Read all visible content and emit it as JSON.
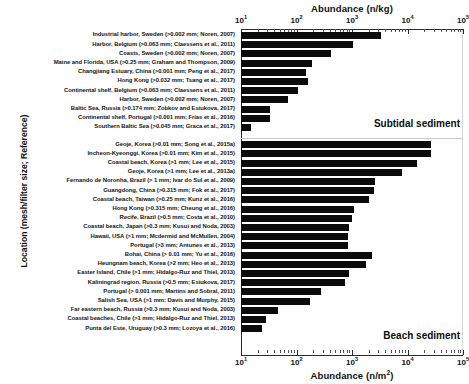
{
  "chart_data": {
    "type": "bar",
    "orientation": "horizontal",
    "title": "",
    "xlabel_top": "Abundance (n/kg)",
    "xlabel_bottom": "Abundance (n/m2)",
    "ylabel": "Location (mesh/filter size; Reference)",
    "xscale": "log",
    "xlim": [
      10,
      100000
    ],
    "grid": false,
    "legend": null,
    "tick_labels": [
      "10^1",
      "10^2",
      "10^3",
      "10^4",
      "10^5"
    ],
    "tick_values": [
      10,
      100,
      1000,
      10000,
      100000
    ],
    "annotations": [
      "Subtidal sediment",
      "Beach sediment"
    ],
    "groups": [
      {
        "name": "Subtidal sediment",
        "axis": "top",
        "unit": "n/kg",
        "categories": [
          "Industrial harbor, Sweden (>0.002 mm; Noren, 2007)",
          "Harbor, Belgium (>0.063 mm; Claessens et al., 2011)",
          "Coasts, Sweden (>0.002 mm; Noren, 2007)",
          "Maine and Florida, USA (>0.25 mm; Graham and Thompson, 2009)",
          "Changjiang Estuary, China (>0.001 mm; Peng et al., 2017)",
          "Hong Kong (>0.032 mm; Tsang et al., 2017)",
          "Continental shelf, Belgium (>0.063 mm; Claessens et al., 2011)",
          "Harbor, Sweden (>0.002 mm; Noren, 2007)",
          "Baltic Sea, Russia (>0.174 mm; Zobkov and Esiukova, 2017)",
          "Continental shelf, Portugal (>0.001 mm; Frias et al., 2016)",
          "Southern Baltic Sea (>0.045 mm; Graca et al., 2017)"
        ],
        "values": [
          3400,
          1050,
          420,
          190,
          150,
          160,
          105,
          70,
          33,
          34,
          15
        ]
      },
      {
        "name": "Beach sediment",
        "axis": "bottom",
        "unit": "n/m2",
        "categories": [
          "Geoje, Korea (>0.01 mm; Song et al., 2015a)",
          "Incheon-Kyeonggi, Korea (>0.01 mm; Kim et al., 2015)",
          "Coastal beach, Korea (>1 mm; Lee et al., 2015)",
          "Geoje, Korea (>1 mm; Lee et al., 2013a)",
          "Fernando de Noronha, Brazil (> 1 mm; Ivar do Sul et al., 2009)",
          "Guangdong, China (>0.315 mm; Fok et al., 2017)",
          "Coastal beach, Taiwan (>0.25 mm; Kunz et al., 2016)",
          "Hong Kong (>0.315 mm; Cheung et al., 2016)",
          "Recife, Brazil (>0.5 mm; Costa et al., 2010)",
          "Coastal beach, Japan (>0.3 mm; Kusui and Noda, 2003)",
          "Hawaii, USA (>1 mm; Mcdermid and McMullen, 2004)",
          "Portugal (>3 mm; Antunes et al., 2013)",
          "Bohai, China (> 0.01 mm; Yu et al., 2016)",
          "Heungnam beach, Korea (>2 mm; Heo et al., 2013)",
          "Easter Island, Chile (>1 mm; Hidalgo-Ruz and Thiel, 2013)",
          "Kaliningrad region, Russia (>0.5 mm; Esiukova, 2017)",
          "Portugal (> 0.001 mm; Martins and Sobral, 2011)",
          "Salish Sea, USA (>1 mm; Davis and Murphy, 2015)",
          "Far eastern beach, Russia (>0.3 mm; Kusui and Noda, 2003)",
          "Coastal beaches, Chile (>1 mm; Hidalgo-Ruz and Thiel, 2013)",
          "Punta del Este, Uruguay (>0.3 mm; Lozoya et al., 2016)"
        ],
        "values": [
          27000,
          27000,
          15000,
          8000,
          2600,
          2500,
          2000,
          1100,
          980,
          900,
          860,
          830,
          2300,
          1800,
          900,
          760,
          280,
          175,
          46,
          28,
          24,
          22
        ]
      }
    ]
  }
}
